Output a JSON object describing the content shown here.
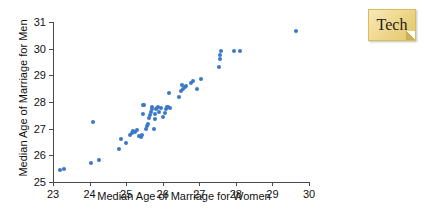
{
  "badge": {
    "label": "Tech"
  },
  "chart_data": {
    "type": "scatter",
    "title": "",
    "xlabel": "Median Age of Marriage for Women",
    "ylabel": "Median Age of Marriage for Men",
    "xlim": [
      23,
      30
    ],
    "ylim": [
      25,
      31
    ],
    "xticks": [
      23,
      24,
      25,
      26,
      27,
      28,
      29,
      30
    ],
    "yticks": [
      25,
      26,
      27,
      28,
      29,
      30,
      31
    ],
    "grid": false,
    "legend": null,
    "marker_color": "#3b78c8",
    "series": [
      {
        "name": "States",
        "points": [
          [
            23.2,
            25.45
          ],
          [
            23.3,
            25.5
          ],
          [
            24.05,
            25.72
          ],
          [
            24.25,
            25.82
          ],
          [
            24.1,
            27.25
          ],
          [
            24.8,
            26.25
          ],
          [
            24.85,
            26.62
          ],
          [
            25.0,
            26.45
          ],
          [
            25.1,
            26.78
          ],
          [
            25.15,
            26.85
          ],
          [
            25.2,
            26.9
          ],
          [
            25.25,
            26.88
          ],
          [
            25.3,
            26.95
          ],
          [
            25.35,
            26.72
          ],
          [
            25.4,
            26.7
          ],
          [
            25.42,
            26.78
          ],
          [
            25.45,
            27.55
          ],
          [
            25.45,
            27.88
          ],
          [
            25.5,
            27.9
          ],
          [
            25.55,
            27.0
          ],
          [
            25.58,
            27.1
          ],
          [
            25.6,
            27.18
          ],
          [
            25.62,
            27.4
          ],
          [
            25.65,
            27.5
          ],
          [
            25.68,
            27.62
          ],
          [
            25.7,
            27.72
          ],
          [
            25.72,
            27.8
          ],
          [
            25.75,
            27.0
          ],
          [
            25.78,
            27.35
          ],
          [
            25.8,
            27.55
          ],
          [
            25.82,
            27.72
          ],
          [
            25.85,
            27.78
          ],
          [
            25.88,
            27.8
          ],
          [
            25.9,
            27.62
          ],
          [
            25.95,
            27.78
          ],
          [
            26.0,
            27.45
          ],
          [
            26.05,
            27.6
          ],
          [
            26.1,
            27.75
          ],
          [
            26.12,
            27.82
          ],
          [
            26.15,
            27.8
          ],
          [
            26.18,
            28.35
          ],
          [
            26.2,
            27.78
          ],
          [
            26.45,
            28.18
          ],
          [
            26.5,
            28.4
          ],
          [
            26.52,
            28.62
          ],
          [
            26.55,
            28.5
          ],
          [
            26.6,
            28.55
          ],
          [
            26.65,
            28.6
          ],
          [
            26.78,
            28.7
          ],
          [
            26.82,
            28.78
          ],
          [
            26.95,
            28.48
          ],
          [
            27.05,
            28.85
          ],
          [
            27.55,
            29.3
          ],
          [
            27.58,
            29.62
          ],
          [
            27.58,
            29.78
          ],
          [
            27.6,
            29.92
          ],
          [
            27.95,
            29.92
          ],
          [
            28.1,
            29.92
          ],
          [
            29.65,
            30.65
          ]
        ]
      }
    ]
  }
}
